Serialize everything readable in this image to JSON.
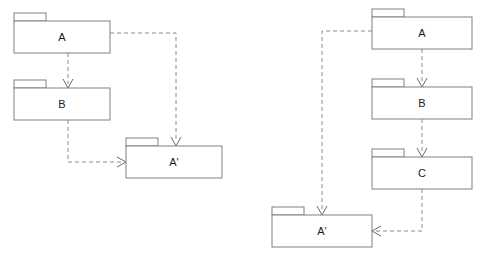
{
  "diagram": {
    "kind": "uml-package-diagram",
    "canvas": {
      "width": 486,
      "height": 257,
      "background": "#ffffff"
    },
    "style": {
      "package_stroke": "#808080",
      "package_fill": "#ffffff",
      "dependency_stroke": "#8c8c8c",
      "arrowhead_stroke": "#6b6b6b",
      "label_color": "#1a1a1a",
      "dependency_dash": "dashed",
      "arrowhead_style": "open"
    },
    "left": {
      "id": "left-diagram",
      "packages": [
        {
          "id": "left-a",
          "label": "A",
          "x": 14,
          "y": 21,
          "width": 96,
          "height": 32,
          "tab_width": 32,
          "tab_height": 8
        },
        {
          "id": "left-b",
          "label": "B",
          "x": 14,
          "y": 88,
          "width": 96,
          "height": 32,
          "tab_width": 32,
          "tab_height": 8
        },
        {
          "id": "left-aprime",
          "label": "A'",
          "x": 126,
          "y": 146,
          "width": 96,
          "height": 32,
          "tab_width": 32,
          "tab_height": 8
        }
      ],
      "dependencies": [
        {
          "id": "left-a-to-b",
          "from": "A",
          "to": "B",
          "path": "M 68 53 L 68 84",
          "head_at": [
            68,
            88
          ],
          "head_dir": "down"
        },
        {
          "id": "left-a-to-aprime",
          "from": "A",
          "to": "A'",
          "path": "M 110 33 L 176 33 L 176 142",
          "head_at": [
            176,
            146
          ],
          "head_dir": "down"
        },
        {
          "id": "left-b-to-aprime",
          "from": "B",
          "to": "A'",
          "path": "M 68 120 L 68 162 L 122 162",
          "head_at": [
            126,
            162
          ],
          "head_dir": "right"
        }
      ]
    },
    "right": {
      "id": "right-diagram",
      "packages": [
        {
          "id": "right-a",
          "label": "A",
          "x": 372,
          "y": 17,
          "width": 100,
          "height": 32,
          "tab_width": 32,
          "tab_height": 8
        },
        {
          "id": "right-b",
          "label": "B",
          "x": 372,
          "y": 87,
          "width": 100,
          "height": 32,
          "tab_width": 32,
          "tab_height": 8
        },
        {
          "id": "right-c",
          "label": "C",
          "x": 372,
          "y": 157,
          "width": 100,
          "height": 32,
          "tab_width": 32,
          "tab_height": 8
        },
        {
          "id": "right-aprime",
          "label": "A'",
          "x": 272,
          "y": 215,
          "width": 100,
          "height": 32,
          "tab_width": 32,
          "tab_height": 8
        }
      ],
      "dependencies": [
        {
          "id": "right-a-to-b",
          "from": "A",
          "to": "B",
          "path": "M 422 49 L 422 83",
          "head_at": [
            422,
            87
          ],
          "head_dir": "down"
        },
        {
          "id": "right-b-to-c",
          "from": "B",
          "to": "C",
          "path": "M 422 119 L 422 153",
          "head_at": [
            422,
            157
          ],
          "head_dir": "down"
        },
        {
          "id": "right-a-to-aprime",
          "from": "A",
          "to": "A'",
          "path": "M 372 31 L 322 31 L 322 211",
          "head_at": [
            322,
            215
          ],
          "head_dir": "down"
        },
        {
          "id": "right-c-to-aprime",
          "from": "C",
          "to": "A'",
          "path": "M 422 189 L 422 231 L 376 231",
          "head_at": [
            372,
            231
          ],
          "head_dir": "left"
        }
      ]
    }
  }
}
